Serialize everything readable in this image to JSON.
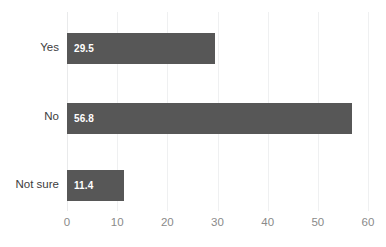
{
  "chart_data": {
    "type": "bar",
    "orientation": "horizontal",
    "title": "",
    "subtitle": "",
    "xlabel": "",
    "ylabel": "",
    "categories": [
      "Yes",
      "No",
      "Not sure"
    ],
    "values": [
      29.5,
      56.8,
      11.4
    ],
    "value_labels": [
      "29.5",
      "56.8",
      "11.4"
    ],
    "xlim": [
      0,
      60
    ],
    "xticks": [
      0,
      10,
      20,
      30,
      40,
      50,
      60
    ],
    "xtick_labels": [
      "0",
      "10",
      "20",
      "30",
      "40",
      "50",
      "60"
    ],
    "grid": true,
    "grid_axis": "x",
    "legend": false,
    "legend_position": "none",
    "series": [
      {
        "name": "",
        "values": [
          29.5,
          56.8,
          11.4
        ]
      }
    ]
  },
  "style": {
    "bar_color": "#575757",
    "value_label_color": "#ffffff",
    "category_label_color": "#3c3c3c",
    "tick_label_color": "#8a8a8a",
    "gridline_color": "#eff0f1",
    "background_color": "#ffffff"
  }
}
